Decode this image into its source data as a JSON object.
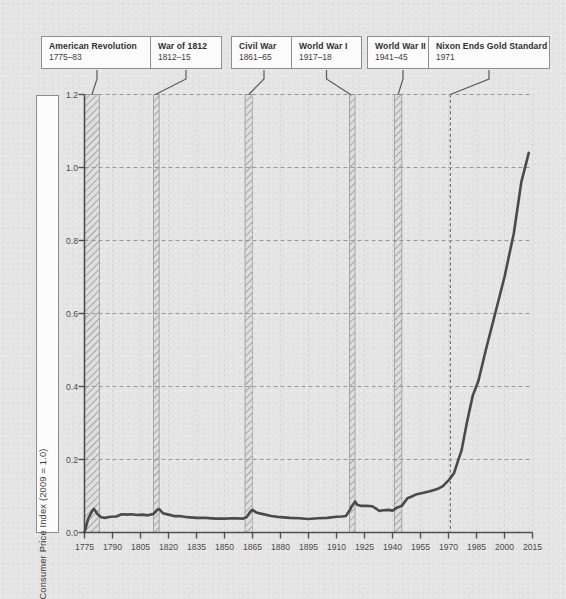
{
  "chart_data": {
    "type": "line",
    "title": "",
    "xlabel": "",
    "ylabel": "Consumer Price Index (2009 = 1.0)",
    "xlim": [
      1775,
      2015
    ],
    "ylim": [
      0.0,
      1.2
    ],
    "xticks": [
      "1775",
      "1790",
      "1805",
      "1820",
      "1835",
      "1850",
      "1865",
      "1880",
      "1895",
      "1910",
      "1925",
      "1940",
      "1955",
      "1970",
      "1985",
      "2000",
      "2015"
    ],
    "yticks": [
      "0.0",
      "0.2",
      "0.4",
      "0.6",
      "0.8",
      "1.0",
      "1.2"
    ],
    "grid": true,
    "legend": "none",
    "line_color": "#4a4a4a",
    "series": [
      {
        "name": "Consumer Price Index (2009 = 1.0)",
        "x": [
          1775,
          1777,
          1779,
          1780,
          1782,
          1784,
          1786,
          1789,
          1792,
          1795,
          1798,
          1800,
          1803,
          1806,
          1809,
          1812,
          1814,
          1815,
          1817,
          1820,
          1823,
          1826,
          1830,
          1835,
          1840,
          1845,
          1850,
          1855,
          1860,
          1862,
          1864,
          1865,
          1867,
          1870,
          1875,
          1880,
          1885,
          1890,
          1895,
          1900,
          1905,
          1910,
          1913,
          1915,
          1917,
          1918,
          1920,
          1921,
          1923,
          1926,
          1929,
          1931,
          1933,
          1935,
          1938,
          1940,
          1942,
          1945,
          1948,
          1950,
          1953,
          1956,
          1960,
          1964,
          1967,
          1970,
          1971,
          1973,
          1975,
          1977,
          1980,
          1983,
          1986,
          1990,
          1995,
          2000,
          2005,
          2009,
          2013
        ],
        "y": [
          0.0,
          0.038,
          0.058,
          0.065,
          0.05,
          0.042,
          0.04,
          0.043,
          0.044,
          0.05,
          0.049,
          0.05,
          0.048,
          0.049,
          0.047,
          0.051,
          0.062,
          0.064,
          0.053,
          0.049,
          0.045,
          0.045,
          0.042,
          0.04,
          0.04,
          0.038,
          0.038,
          0.039,
          0.038,
          0.043,
          0.058,
          0.062,
          0.055,
          0.051,
          0.045,
          0.042,
          0.04,
          0.039,
          0.037,
          0.039,
          0.04,
          0.043,
          0.044,
          0.045,
          0.06,
          0.07,
          0.085,
          0.076,
          0.073,
          0.073,
          0.072,
          0.066,
          0.059,
          0.061,
          0.062,
          0.06,
          0.067,
          0.073,
          0.094,
          0.098,
          0.105,
          0.108,
          0.113,
          0.119,
          0.127,
          0.143,
          0.149,
          0.163,
          0.195,
          0.225,
          0.305,
          0.375,
          0.415,
          0.5,
          0.6,
          0.7,
          0.82,
          0.96,
          1.04
        ]
      }
    ],
    "event_bands": [
      {
        "label": "American Revolution",
        "years": "1775–83",
        "start": 1775,
        "end": 1783,
        "style": "hatch"
      },
      {
        "label": "War of 1812",
        "years": "1812–15",
        "start": 1812,
        "end": 1815,
        "style": "hatch"
      },
      {
        "label": "Civil War",
        "years": "1861–65",
        "start": 1861,
        "end": 1865,
        "style": "hatch"
      },
      {
        "label": "World War I",
        "years": "1917–18",
        "start": 1917,
        "end": 1918,
        "style": "hatch"
      },
      {
        "label": "World War II",
        "years": "1941–45",
        "start": 1941,
        "end": 1945,
        "style": "hatch"
      },
      {
        "label": "Nixon Ends Gold Standard",
        "years": "1971",
        "start": 1971,
        "end": 1971,
        "style": "dashed-line"
      }
    ]
  },
  "callouts": [
    {
      "title": "American Revolution",
      "years": "1775–83"
    },
    {
      "title": "War of 1812",
      "years": "1812–15"
    },
    {
      "title": "Civil War",
      "years": "1861–65"
    },
    {
      "title": "World War I",
      "years": "1917–18"
    },
    {
      "title": "World War II",
      "years": "1941–45"
    },
    {
      "title": "Nixon Ends Gold Standard",
      "years": "1971"
    }
  ],
  "axes": {
    "y_axis_label": "Consumer Price Index (2009 = 1.0)"
  }
}
